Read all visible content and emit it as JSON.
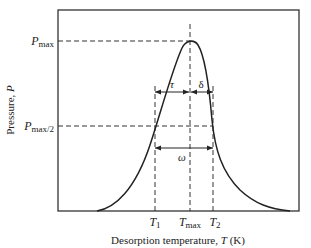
{
  "diagram": {
    "x_axis_label": "Desorption temperature, T (K)",
    "x_axis": {
      "prefix": "Desorption temperature, ",
      "var": "T",
      "unit": " (K)"
    },
    "y_axis_label": "Pressure, P",
    "y_axis": {
      "prefix": "Pressure, ",
      "var": "P"
    },
    "y_ticks": [
      {
        "base": "P",
        "sub": "max"
      },
      {
        "base": "P",
        "sub": "max/2"
      }
    ],
    "x_ticks": [
      {
        "base": "T",
        "sub": "1"
      },
      {
        "base": "T",
        "sub": "max"
      },
      {
        "base": "T",
        "sub": "2"
      }
    ],
    "annotations": {
      "tau": "τ",
      "delta": "δ",
      "omega": "ω"
    },
    "colors": {
      "line": "#222222",
      "background": "#ffffff"
    }
  }
}
